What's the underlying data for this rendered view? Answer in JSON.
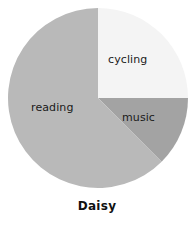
{
  "chart_data": {
    "type": "pie",
    "title": "Daisy",
    "subtitle": "",
    "xlabel": "",
    "ylabel": "",
    "legend_position": "none",
    "grid": false,
    "labels_inside": true,
    "categories": [
      "cycling",
      "music",
      "reading"
    ],
    "values": [
      25,
      12.5,
      62.5
    ],
    "units": "percent",
    "slices": [
      {
        "label": "cycling",
        "value": 25,
        "percent": 25,
        "start_angle_deg": 0,
        "end_angle_deg": 90,
        "color": "#f4f4f4"
      },
      {
        "label": "music",
        "value": 12.5,
        "percent": 12.5,
        "start_angle_deg": 90,
        "end_angle_deg": 135,
        "color": "#a3a3a3"
      },
      {
        "label": "reading",
        "value": 62.5,
        "percent": 62.5,
        "start_angle_deg": 135,
        "end_angle_deg": 360,
        "color": "#b9b9b9"
      }
    ],
    "geometry": {
      "center_x": 98,
      "center_y": 98,
      "radius": 90
    },
    "colors": {
      "cycling": "#f4f4f4",
      "music": "#a3a3a3",
      "reading": "#b9b9b9",
      "title_text": "#111111",
      "label_text": "#1a1a1a",
      "background": "#ffffff"
    }
  },
  "labels": {
    "cycling": "cycling",
    "music": "music",
    "reading": "reading"
  },
  "title": "Daisy"
}
